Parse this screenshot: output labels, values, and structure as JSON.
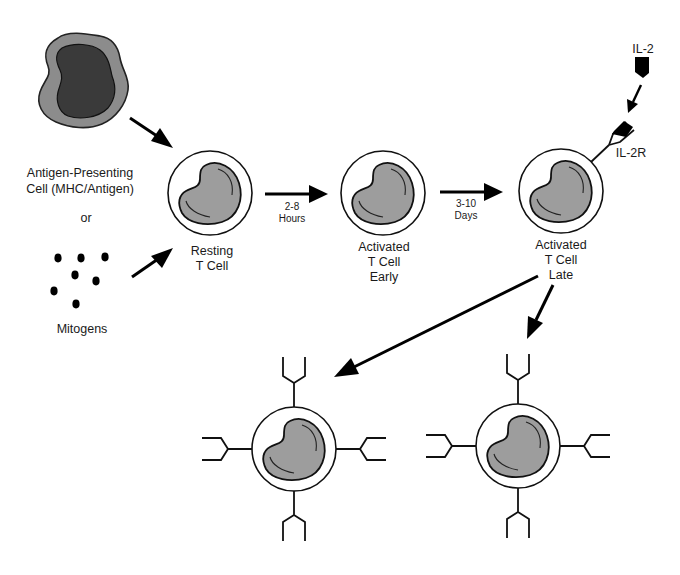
{
  "diagram": {
    "inputs": {
      "apc_label_line1": "Antigen-Presenting",
      "apc_label_line2": "Cell (MHC/Antigen)",
      "or_label": "or",
      "mitogens_label": "Mitogens"
    },
    "stages": [
      {
        "line1": "Resting",
        "line2": "T Cell",
        "line3": ""
      },
      {
        "line1": "Activated",
        "line2": "T Cell",
        "line3": "Early"
      },
      {
        "line1": "Activated",
        "line2": "T Cell",
        "line3": "Late"
      }
    ],
    "transitions": [
      {
        "line1": "2-8",
        "line2": "Hours"
      },
      {
        "line1": "3-10",
        "line2": "Days"
      }
    ],
    "cytokine": {
      "ligand_label": "IL-2",
      "receptor_label": "IL-2R"
    },
    "outputs": {
      "count": 2,
      "description": "Cells expressing surface receptors (antibody-like, Y-shaped)"
    },
    "colors": {
      "nucleus": "#9d9d9d",
      "apc_outer": "#8c8c8c",
      "apc_inner": "#3a3a3a",
      "stroke": "#111111",
      "background": "#ffffff"
    }
  }
}
